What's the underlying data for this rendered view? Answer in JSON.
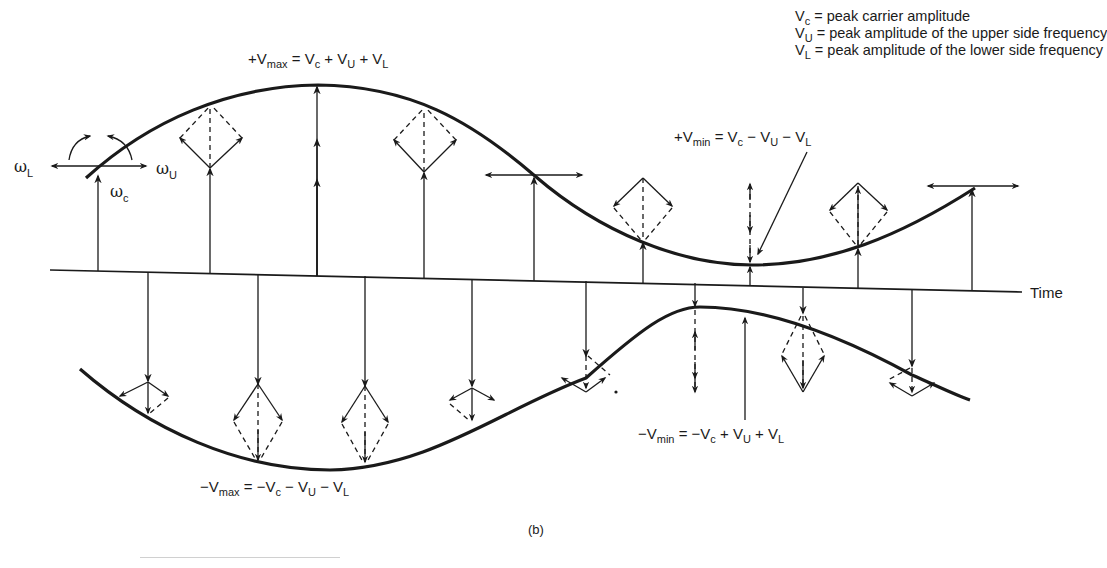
{
  "legend": {
    "items": [
      {
        "symbol": "V",
        "sub": "c",
        "text": " = peak carrier amplitude"
      },
      {
        "symbol": "V",
        "sub": "U",
        "text": " = peak amplitude of the upper side frequency"
      },
      {
        "symbol": "V",
        "sub": "L",
        "text": " = peak amplitude of the lower side frequency"
      }
    ]
  },
  "annotations": {
    "plus_vmax": {
      "prefix": "+V",
      "sub": "max",
      "eq": " = V",
      "s1": "c",
      "p1": " + V",
      "s2": "U",
      "p2": " + V",
      "s3": "L"
    },
    "plus_vmin": {
      "prefix": "+V",
      "sub": "min",
      "eq": " = V",
      "s1": "c",
      "p1": " − V",
      "s2": "U",
      "p2": " − V",
      "s3": "L"
    },
    "minus_vmax": {
      "prefix": "−V",
      "sub": "max",
      "eq": " = −V",
      "s1": "c",
      "p1": " − V",
      "s2": "U",
      "p2": " − V",
      "s3": "L"
    },
    "minus_vmin": {
      "prefix": "−V",
      "sub": "min",
      "eq": " = −V",
      "s1": "c",
      "p1": " + V",
      "s2": "U",
      "p2": " + V",
      "s3": "L"
    }
  },
  "phasor_labels": {
    "omega_l": {
      "symbol": "ω",
      "sub": "L"
    },
    "omega_u": {
      "symbol": "ω",
      "sub": "U"
    },
    "omega_c": {
      "symbol": "ω",
      "sub": "c"
    }
  },
  "axis": {
    "time_label": "Time"
  },
  "caption": "(b)",
  "colors": {
    "ink": "#1a1a1a",
    "background": "#ffffff"
  }
}
